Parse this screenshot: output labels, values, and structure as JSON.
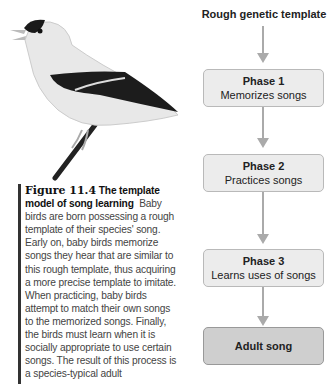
{
  "figure": {
    "image": {
      "subject": "goldfinch-bird-singing-on-branch"
    },
    "caption": {
      "number": "Figure 11.4",
      "title": "The template model of song learning",
      "body": "Baby birds are born possessing a rough template of their species' song. Early on, baby birds memorize songs they hear that are similar to this rough template, thus acquiring a more precise template to imitate. When practicing, baby birds attempt to match their own songs to the memorized songs. Finally, the birds must learn when it is socially appropriate to use certain songs. The result of this process is a species-typical adult"
    },
    "flowchart": {
      "title": "Rough genetic template",
      "phases": [
        {
          "label": "Phase 1",
          "desc": "Memorizes songs"
        },
        {
          "label": "Phase 2",
          "desc": "Practices songs"
        },
        {
          "label": "Phase 3",
          "desc": "Learns uses of songs"
        }
      ],
      "final": "Adult song"
    }
  }
}
